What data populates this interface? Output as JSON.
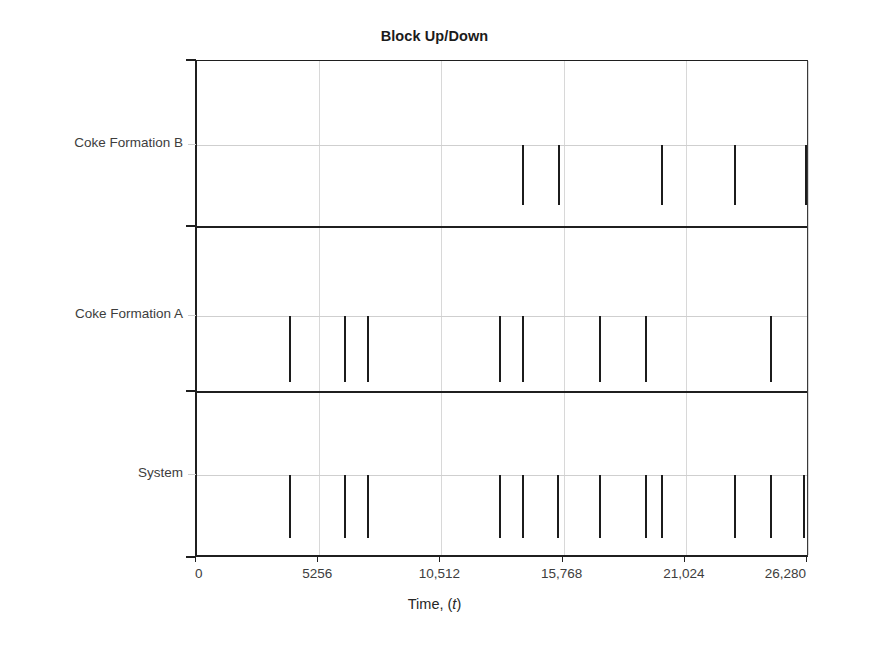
{
  "chart_data": {
    "type": "bar",
    "title": "Block Up/Down",
    "xlabel": "Time, (t)",
    "ylabel": "",
    "orientation": "vertical-downward-from-baseline",
    "xlim": [
      0,
      26280
    ],
    "xticks": [
      0,
      5256,
      10512,
      15768,
      21024,
      26280
    ],
    "xtick_labels": [
      "0",
      "5256",
      "10,512",
      "15,768",
      "21,024",
      "26,280"
    ],
    "grid": true,
    "legend": false,
    "panels": [
      {
        "label": "Coke Formation B",
        "baseline_fraction": 0.51,
        "bar_height_fraction": 0.36,
        "values": [
          13970,
          15520,
          19940,
          23080,
          26140
        ]
      },
      {
        "label": "Coke Formation A",
        "baseline_fraction": 0.54,
        "bar_height_fraction": 0.4,
        "values": [
          3940,
          6340,
          7320,
          12980,
          13970,
          17280,
          19290,
          24630
        ]
      },
      {
        "label": "System",
        "baseline_fraction": 0.5,
        "bar_height_fraction": 0.38,
        "values": [
          3940,
          6340,
          7320,
          12980,
          13970,
          15470,
          17280,
          19290,
          19940,
          23080,
          24630,
          26060
        ]
      }
    ],
    "series_note": "Each tick is an instantaneous down-event drawn as a short vertical line dropping from the panel baseline."
  },
  "axis": {
    "y_categories": [
      "Coke Formation B",
      "Coke Formation A",
      "System"
    ]
  },
  "colors": {
    "bar": "#1c1c1c",
    "axis": "#1f1f1f",
    "grid": "#d8d8d8",
    "text": "#3d3d3d",
    "background": "#ffffff"
  }
}
